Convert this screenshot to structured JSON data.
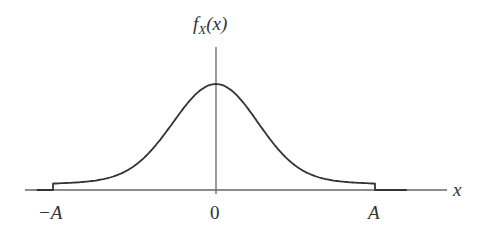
{
  "chart_data": {
    "type": "line",
    "title": "",
    "xlabel": "x",
    "ylabel": "f_X(x)",
    "ylabel_display": {
      "base": "f",
      "sub": "X",
      "arg": "(x)"
    },
    "x_ticks": [
      "−A",
      "0",
      "A"
    ],
    "x_tick_values": [
      -1,
      0,
      1
    ],
    "xlim": [
      -1.1,
      1.2
    ],
    "grid": false,
    "legend": null,
    "series": [
      {
        "name": "f_X(x)",
        "x": [
          -1.1,
          -1.0,
          -1.0,
          -0.8,
          -0.6,
          -0.4,
          -0.3,
          -0.2,
          -0.1,
          0.0,
          0.1,
          0.2,
          0.3,
          0.4,
          0.6,
          0.8,
          1.0,
          1.0,
          1.2
        ],
        "y": [
          0.0,
          0.0,
          0.06,
          0.09,
          0.14,
          0.3,
          0.47,
          0.7,
          0.9,
          1.0,
          0.9,
          0.7,
          0.47,
          0.3,
          0.14,
          0.09,
          0.06,
          0.0,
          0.0
        ]
      }
    ]
  },
  "labels": {
    "y_axis_f": "f",
    "y_axis_sub": "X",
    "y_axis_arg": "(x)",
    "x_axis": "x",
    "tick_neg_a": "−A",
    "tick_zero": "0",
    "tick_pos_a": "A"
  },
  "colors": {
    "axis": "#666666",
    "curve": "#333333",
    "text": "#333333"
  }
}
